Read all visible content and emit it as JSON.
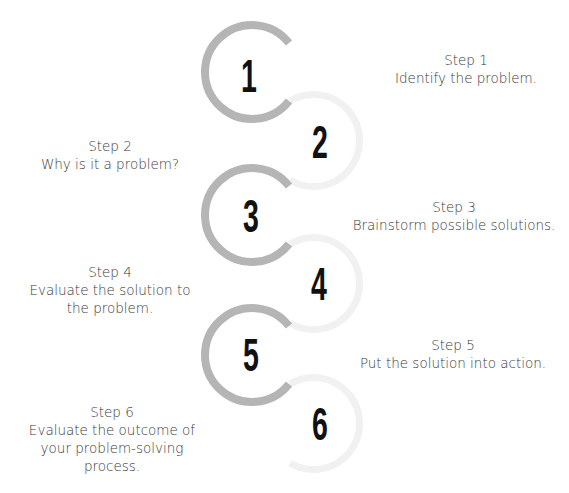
{
  "diagram": {
    "type": "process-steps",
    "colors": {
      "arc": "#b5b5b5",
      "arc_faint": "#f1f1f1",
      "number": "#111111",
      "text": "#3a3a3a"
    },
    "steps": [
      {
        "number": "1",
        "title": "Step 1",
        "description": "Identify the problem."
      },
      {
        "number": "2",
        "title": "Step 2",
        "description": "Why is it a problem?"
      },
      {
        "number": "3",
        "title": "Step 3",
        "description": "Brainstorm possible solutions."
      },
      {
        "number": "4",
        "title": "Step 4",
        "description": "Evaluate the solution to the problem."
      },
      {
        "number": "5",
        "title": "Step 5",
        "description": "Put the solution into action."
      },
      {
        "number": "6",
        "title": "Step 6",
        "description": "Evaluate the outcome of your problem-solving process."
      }
    ]
  }
}
